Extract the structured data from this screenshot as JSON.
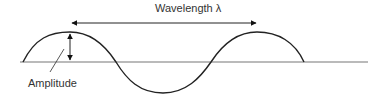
{
  "diagram": {
    "labels": {
      "wavelength": "Wavelength λ",
      "amplitude": "Amplitude"
    },
    "colors": {
      "line": "#222222",
      "axis": "#777777",
      "text": "#333333"
    }
  }
}
